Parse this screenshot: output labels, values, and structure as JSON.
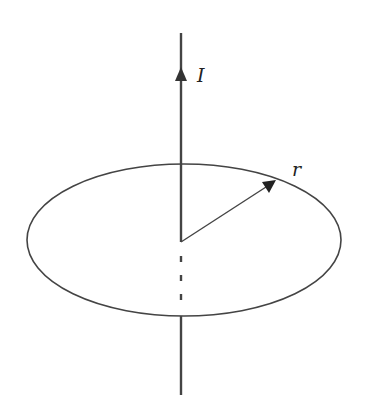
{
  "diagram": {
    "labels": {
      "current": "I",
      "radius": "r"
    },
    "colors": {
      "stroke": "#444444",
      "background": "#ffffff"
    },
    "wire": {
      "x": 181,
      "y_top": 33,
      "y_bottom": 395,
      "direction": "up"
    },
    "loop": {
      "cx": 184,
      "cy": 240,
      "rx": 157,
      "ry": 76
    },
    "radius_vector": {
      "from": [
        181,
        242
      ],
      "to": [
        275,
        181
      ]
    },
    "hidden_wire_dashes": [
      259,
      278,
      297
    ]
  }
}
